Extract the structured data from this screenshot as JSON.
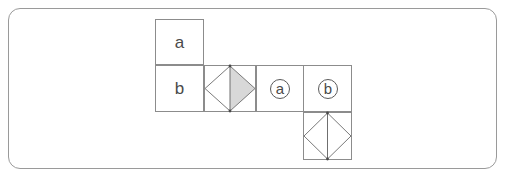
{
  "figure": {
    "panel_name": "cube-net-figure-panel",
    "border_color": "#9a9a9a",
    "background_color": "#ffffff",
    "grid_line_color": "#8c8c8c",
    "shape_line_color": "#6f6f6f",
    "shaded_fill_color": "#d8d8d8",
    "text_color": "#4a4a4a"
  },
  "cells": [
    {
      "id": "cell-a-top",
      "name": "net-cell-a",
      "label": "a",
      "kind": "letter",
      "x": 155,
      "y": 19,
      "width": 49,
      "height": 46
    },
    {
      "id": "cell-b-left",
      "name": "net-cell-b",
      "label": "b",
      "kind": "letter",
      "x": 155,
      "y": 65,
      "width": 49,
      "height": 47
    },
    {
      "id": "cell-diamond-shaded",
      "name": "net-cell-diamond-shaded",
      "label": "",
      "kind": "diamond-half-shaded",
      "x": 204,
      "y": 65,
      "width": 52,
      "height": 47
    },
    {
      "id": "cell-circled-a",
      "name": "net-cell-circled-a",
      "label": "a",
      "kind": "circled-letter",
      "x": 256,
      "y": 65,
      "width": 48,
      "height": 47
    },
    {
      "id": "cell-circled-b",
      "name": "net-cell-circled-b",
      "label": "b",
      "kind": "circled-letter",
      "x": 304,
      "y": 65,
      "width": 48,
      "height": 47
    },
    {
      "id": "cell-diamond-open",
      "name": "net-cell-diamond-open",
      "label": "",
      "kind": "diamond-open",
      "x": 304,
      "y": 112,
      "width": 48,
      "height": 48
    }
  ],
  "labels": {
    "letter_a": "a",
    "letter_b": "b",
    "circled_a": "a",
    "circled_b": "b"
  }
}
